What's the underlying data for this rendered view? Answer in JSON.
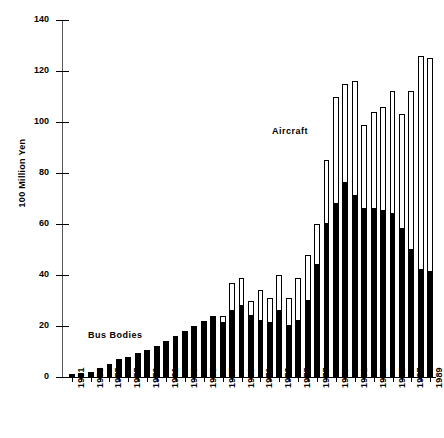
{
  "chart_data": {
    "type": "bar",
    "subtype": "stacked",
    "title": "",
    "xlabel": "",
    "ylabel": "100 Million Yen",
    "ylim": [
      0,
      140
    ],
    "yticks": [
      0,
      20,
      40,
      60,
      80,
      100,
      120,
      140
    ],
    "grid": false,
    "legend_position": "inline-annotations",
    "x_tick_step_years": 2,
    "categories": [
      "1951",
      "1952",
      "1953",
      "1954",
      "1955",
      "1956",
      "1957",
      "1958",
      "1959",
      "1960",
      "1961",
      "1962",
      "1963",
      "1964",
      "1965",
      "1966",
      "1967",
      "1968",
      "1969",
      "1970",
      "1971",
      "1972",
      "1973",
      "1974",
      "1975",
      "1976",
      "1977",
      "1978",
      "1979",
      "1980",
      "1981",
      "1982",
      "1983",
      "1984",
      "1985",
      "1986",
      "1987",
      "1988",
      "1989"
    ],
    "tick_labels": [
      "1951",
      "1953",
      "1955",
      "1957",
      "1959",
      "1961",
      "1963",
      "1965",
      "1967",
      "1969",
      "1971",
      "1973",
      "1975",
      "1977",
      "1979",
      "1981",
      "1983",
      "1985",
      "1987",
      "1989"
    ],
    "series": [
      {
        "name": "Bus Bodies",
        "color": "#000000",
        "values": [
          1,
          1.5,
          2,
          3.5,
          5,
          7,
          8,
          9.5,
          10.5,
          12,
          14,
          16,
          18,
          20,
          22,
          24,
          21,
          26,
          28,
          24,
          22,
          21,
          26,
          20,
          22,
          30,
          44,
          60,
          68,
          76,
          71,
          66,
          66,
          65,
          64,
          58,
          50,
          42,
          41
        ]
      },
      {
        "name": "Aircraft",
        "color": "#ffffff",
        "values": [
          0,
          0,
          0,
          0,
          0,
          0,
          0,
          0,
          0,
          0,
          0,
          0,
          0,
          0,
          0,
          0,
          3,
          11,
          11,
          6,
          12,
          10,
          14,
          11,
          17,
          18,
          16,
          25,
          42,
          39,
          45,
          33,
          38,
          41,
          48,
          45,
          62,
          84,
          84
        ]
      }
    ],
    "totals": [
      1,
      1.5,
      2,
      3.5,
      5,
      7,
      8,
      9.5,
      10.5,
      12,
      14,
      16,
      18,
      20,
      22,
      24,
      24,
      37,
      39,
      30,
      34,
      31,
      40,
      31,
      39,
      48,
      60,
      85,
      110,
      115,
      116,
      99,
      104,
      106,
      112,
      103,
      112,
      126,
      125
    ],
    "annotations": [
      {
        "text": "Bus Bodies",
        "series": "Bus Bodies"
      },
      {
        "text": "Aircraft",
        "series": "Aircraft"
      }
    ]
  }
}
